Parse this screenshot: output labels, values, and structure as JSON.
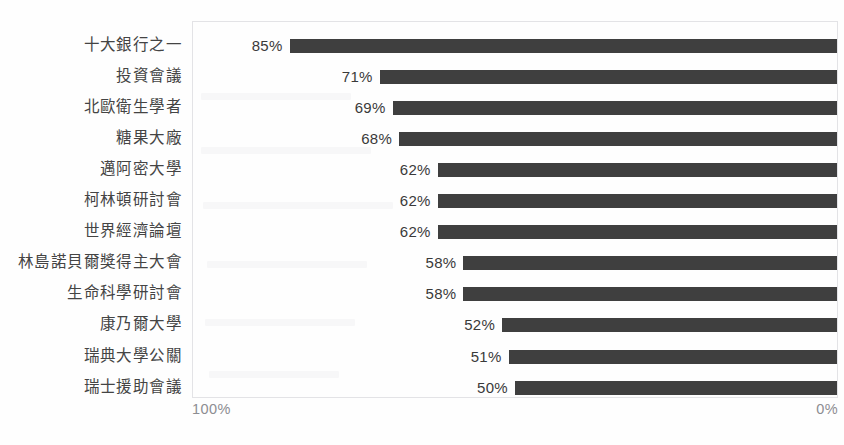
{
  "chart_data": {
    "type": "bar",
    "orientation": "horizontal",
    "title": "",
    "subtitle": "",
    "xlabel": "",
    "ylabel": "",
    "grid": false,
    "legend": false,
    "legend_position": "none",
    "axis_reversed": true,
    "xlim": [
      100,
      0
    ],
    "value_suffix": "%",
    "axis_ticks": [
      "100%",
      "0%"
    ],
    "bar_color": "#3f3f3f",
    "label_color": "#444444",
    "value_label_color": "#3a3a3a",
    "axis_label_color": "#8d8d92",
    "plot_border_color": "#e3e3e6",
    "background_color": "#fefefe",
    "categories": [
      "十大銀行之一",
      "投資會議",
      "北歐衛生學者",
      "糖果大廠",
      "邁阿密大學",
      "柯林頓研討會",
      "世界經濟論壇",
      "林島諾貝爾獎得主大會",
      "生命科學研討會",
      "康乃爾大學",
      "瑞典大學公關",
      "瑞士援助會議"
    ],
    "values": [
      85,
      71,
      69,
      68,
      62,
      62,
      62,
      58,
      58,
      52,
      51,
      50
    ],
    "data_labels": [
      "85%",
      "71%",
      "69%",
      "68%",
      "62%",
      "62%",
      "62%",
      "58%",
      "58%",
      "52%",
      "51%",
      "50%"
    ]
  }
}
